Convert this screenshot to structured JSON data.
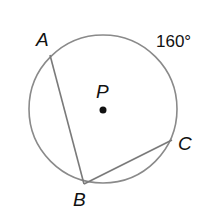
{
  "diagram": {
    "type": "circle-inscribed-angle",
    "center_label": "P",
    "points": [
      {
        "label": "A"
      },
      {
        "label": "B"
      },
      {
        "label": "C"
      }
    ],
    "arc_label": "160°",
    "chords": [
      "AB",
      "BC"
    ],
    "colors": {
      "circle": "#888888",
      "chord": "#777777",
      "text": "#111111",
      "center_dot": "#111111"
    }
  }
}
